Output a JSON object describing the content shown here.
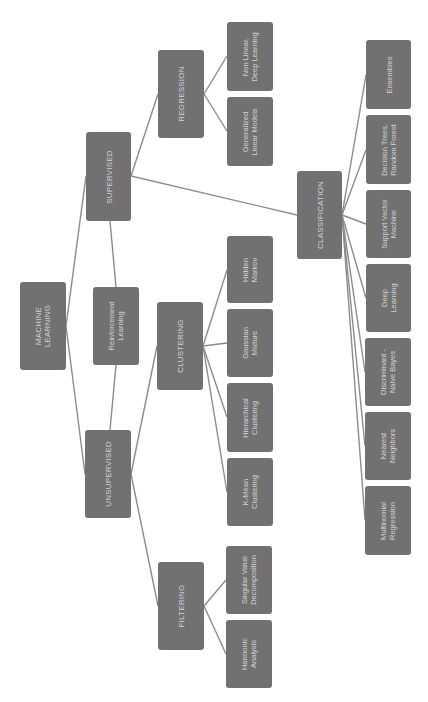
{
  "diagram": {
    "orientation": "rotated-90-ccw",
    "colors": {
      "node_fill": "#717171",
      "node_text": "#d4d4d4",
      "edge": "#8c8c8c",
      "background": "#ffffff"
    },
    "nodes": [
      {
        "id": "ml",
        "label": "MACHINE\nLEARNING",
        "kind": "cat",
        "x": 20,
        "y": 282,
        "w": 46,
        "h": 88
      },
      {
        "id": "sup",
        "label": "SUPERVISED",
        "kind": "cat",
        "x": 86,
        "y": 132,
        "w": 45,
        "h": 89
      },
      {
        "id": "rl",
        "label": "Reinforcement\nLearning",
        "kind": "leaf",
        "x": 93,
        "y": 287,
        "w": 46,
        "h": 78
      },
      {
        "id": "unsup",
        "label": "UNSUPERVISED",
        "kind": "cat",
        "x": 85,
        "y": 430,
        "w": 46,
        "h": 88
      },
      {
        "id": "reg",
        "label": "REGRESSION",
        "kind": "cat",
        "x": 158,
        "y": 50,
        "w": 46,
        "h": 88
      },
      {
        "id": "clus",
        "label": "CLUSTERING",
        "kind": "cat",
        "x": 157,
        "y": 302,
        "w": 46,
        "h": 88
      },
      {
        "id": "filt",
        "label": "FILTERING",
        "kind": "cat",
        "x": 158,
        "y": 562,
        "w": 46,
        "h": 88
      },
      {
        "id": "nonlin",
        "label": "Non Linear,\nDeep Learning",
        "kind": "leaf",
        "x": 227,
        "y": 22,
        "w": 46,
        "h": 69
      },
      {
        "id": "glm",
        "label": "Generalized\nLinear Models",
        "kind": "leaf",
        "x": 227,
        "y": 97,
        "w": 46,
        "h": 69
      },
      {
        "id": "hmm",
        "label": "Hidden\nMarkov",
        "kind": "leaf",
        "x": 227,
        "y": 236,
        "w": 46,
        "h": 67
      },
      {
        "id": "gmm",
        "label": "Gaussian\nMixture",
        "kind": "leaf",
        "x": 227,
        "y": 309,
        "w": 46,
        "h": 68
      },
      {
        "id": "hier",
        "label": "Hierarchical\nClustering",
        "kind": "leaf",
        "x": 227,
        "y": 383,
        "w": 46,
        "h": 69
      },
      {
        "id": "kmean",
        "label": "K-Mean\nClustering",
        "kind": "leaf",
        "x": 227,
        "y": 458,
        "w": 46,
        "h": 68
      },
      {
        "id": "svd",
        "label": "Singular Value\nDecomposition",
        "kind": "leaf",
        "x": 226,
        "y": 546,
        "w": 46,
        "h": 68
      },
      {
        "id": "harm",
        "label": "Harmonic\nAnalysis",
        "kind": "leaf",
        "x": 226,
        "y": 620,
        "w": 46,
        "h": 68
      },
      {
        "id": "cls",
        "label": "CLASSIFICATION",
        "kind": "cat",
        "x": 297,
        "y": 171,
        "w": 45,
        "h": 88
      },
      {
        "id": "ens",
        "label": "Ensembles",
        "kind": "leaf",
        "x": 366,
        "y": 40,
        "w": 45,
        "h": 69
      },
      {
        "id": "dt",
        "label": "Decision Trees,\nRandom Forest",
        "kind": "leaf",
        "x": 366,
        "y": 115,
        "w": 45,
        "h": 69
      },
      {
        "id": "svm",
        "label": "Support Vector\nMachine",
        "kind": "leaf",
        "x": 366,
        "y": 190,
        "w": 45,
        "h": 68
      },
      {
        "id": "dl",
        "label": "Deep\nLearning",
        "kind": "leaf",
        "x": 366,
        "y": 264,
        "w": 45,
        "h": 68
      },
      {
        "id": "disc",
        "label": "Discriminant -\nNaive Bayes",
        "kind": "leaf",
        "x": 365,
        "y": 338,
        "w": 46,
        "h": 68
      },
      {
        "id": "nn",
        "label": "Nearest\nNeighbors",
        "kind": "leaf",
        "x": 365,
        "y": 412,
        "w": 46,
        "h": 68
      },
      {
        "id": "multi",
        "label": "Multinomial\nRegression",
        "kind": "leaf",
        "x": 365,
        "y": 486,
        "w": 46,
        "h": 69
      }
    ],
    "edges": [
      {
        "x1": 66,
        "y1": 326,
        "x2": 86,
        "y2": 176
      },
      {
        "x1": 66,
        "y1": 326,
        "x2": 85,
        "y2": 474
      },
      {
        "x1": 116,
        "y1": 287,
        "x2": 110,
        "y2": 221
      },
      {
        "x1": 116,
        "y1": 365,
        "x2": 110,
        "y2": 430
      },
      {
        "x1": 131,
        "y1": 176,
        "x2": 158,
        "y2": 94
      },
      {
        "x1": 131,
        "y1": 176,
        "x2": 297,
        "y2": 215
      },
      {
        "x1": 204,
        "y1": 94,
        "x2": 227,
        "y2": 56
      },
      {
        "x1": 204,
        "y1": 94,
        "x2": 227,
        "y2": 131
      },
      {
        "x1": 131,
        "y1": 474,
        "x2": 157,
        "y2": 346
      },
      {
        "x1": 131,
        "y1": 474,
        "x2": 158,
        "y2": 606
      },
      {
        "x1": 203,
        "y1": 346,
        "x2": 227,
        "y2": 270
      },
      {
        "x1": 203,
        "y1": 346,
        "x2": 227,
        "y2": 343
      },
      {
        "x1": 203,
        "y1": 346,
        "x2": 227,
        "y2": 417
      },
      {
        "x1": 203,
        "y1": 346,
        "x2": 227,
        "y2": 492
      },
      {
        "x1": 204,
        "y1": 606,
        "x2": 226,
        "y2": 580
      },
      {
        "x1": 204,
        "y1": 606,
        "x2": 226,
        "y2": 654
      },
      {
        "x1": 342,
        "y1": 215,
        "x2": 366,
        "y2": 75
      },
      {
        "x1": 342,
        "y1": 215,
        "x2": 366,
        "y2": 150
      },
      {
        "x1": 342,
        "y1": 215,
        "x2": 366,
        "y2": 224
      },
      {
        "x1": 342,
        "y1": 215,
        "x2": 366,
        "y2": 298
      },
      {
        "x1": 342,
        "y1": 215,
        "x2": 365,
        "y2": 372
      },
      {
        "x1": 342,
        "y1": 215,
        "x2": 365,
        "y2": 446
      },
      {
        "x1": 342,
        "y1": 215,
        "x2": 365,
        "y2": 520
      }
    ]
  }
}
